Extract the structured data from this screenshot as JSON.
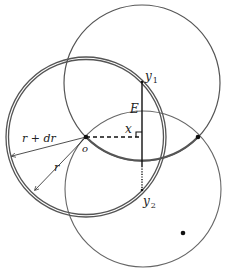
{
  "diagram": {
    "labels": {
      "y1": "y",
      "y1_sub": "1",
      "y2": "y",
      "y2_sub": "2",
      "E": "E",
      "x": "x",
      "o": "o",
      "r_plus_dr": "r + dr",
      "r": "r"
    },
    "colors": {
      "circle_stroke": "#555555",
      "line": "#111111",
      "background": "#ffffff"
    },
    "circles": [
      {
        "name": "top-circle",
        "cx": 142,
        "cy": 82,
        "r": 78
      },
      {
        "name": "shell-inner",
        "cx": 86,
        "cy": 137,
        "r": 77
      },
      {
        "name": "shell-outer",
        "cx": 86,
        "cy": 137,
        "r": 80
      },
      {
        "name": "bottom-circle",
        "cx": 143,
        "cy": 189,
        "r": 78
      }
    ],
    "points": [
      {
        "name": "o",
        "x": 86,
        "y": 137
      },
      {
        "name": "right-intersection",
        "x": 198,
        "y": 137
      },
      {
        "name": "lower-dot",
        "x": 183,
        "y": 233
      },
      {
        "name": "y1",
        "x": 142,
        "y": 82
      },
      {
        "name": "y2",
        "x": 142,
        "y": 190
      }
    ]
  }
}
